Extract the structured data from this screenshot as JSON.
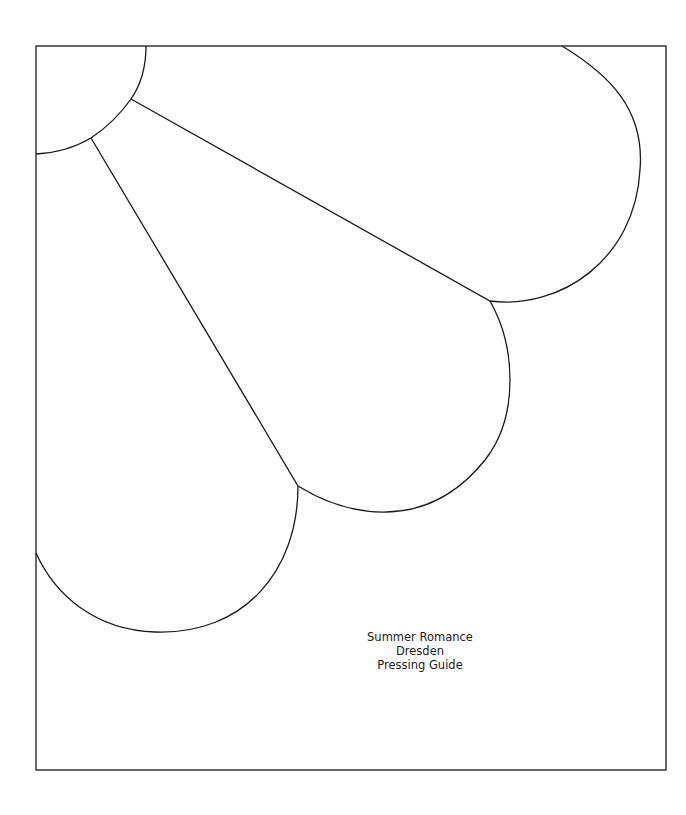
{
  "document": {
    "type": "pressing-guide-template",
    "caption": {
      "line1": "Summer Romance",
      "line2": "Dresden",
      "line3": "Pressing Guide"
    },
    "colors": {
      "background": "#ffffff",
      "line": "#1a1a1a"
    },
    "shapes": [
      "center-quarter-circle",
      "upper-petal",
      "middle-petal",
      "lower-petal",
      "border-frame"
    ]
  }
}
